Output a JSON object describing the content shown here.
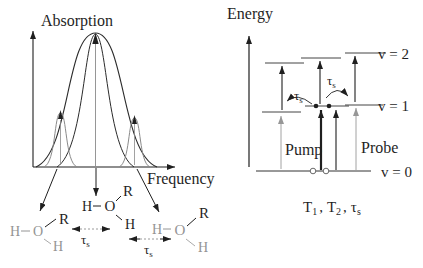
{
  "colors": {
    "ink": "#1f1f1f",
    "gray": "#949494",
    "curve_dark": "#2b2b2b",
    "curve_gray": "#8a8a8a"
  },
  "absorption_plot": {
    "y_axis_label": "Absorption",
    "x_axis_label": "Frequency"
  },
  "molecules": {
    "left": {
      "h_donor": "H",
      "o": "O",
      "r": "R",
      "h_free": "H"
    },
    "middle": {
      "h_donor": "H",
      "o": "O",
      "r": "R",
      "h_free": "H"
    },
    "right": {
      "h_donor": "H",
      "o": "O",
      "r": "R",
      "h_free": "H"
    }
  },
  "tau": {
    "symbol": "τ",
    "subscript": "s"
  },
  "energy_diagram": {
    "axis_label": "Energy",
    "level_v2": "v = 2",
    "level_v1": "v = 1",
    "level_v0": "v = 0",
    "pump_label": "Pump",
    "probe_label": "Probe"
  },
  "caption": {
    "T": "T",
    "sub1": "1",
    "comma": ",",
    "sub2": "2",
    "tau": "τ",
    "tau_sub": "s"
  }
}
